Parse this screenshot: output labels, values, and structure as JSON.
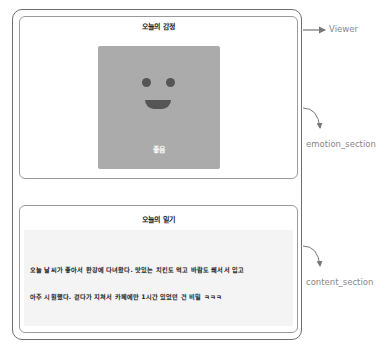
{
  "viewer": {
    "label": "Viewer",
    "emotion_section": {
      "annotation": "emotion_section",
      "title": "오늘의 감정",
      "image": {
        "face": "smiley-face-icon",
        "label": "좋음",
        "background_color": "#ababab",
        "feature_color": "#555555"
      }
    },
    "content_section": {
      "annotation": "content_section",
      "title": "오늘의 일기",
      "lines": [
        "오늘 날씨가 좋아서 한강에 다녀왔다. 맛있는 치킨도 먹고 바람도 쐐서서 입고",
        "아주 시원했다. 걷다가 지쳐서 카페에만 1시간 있었던 건 비밀 ㅋㅋㅋ"
      ]
    }
  },
  "colors": {
    "border": "#6e6e6e",
    "section_border": "#9a9a9a",
    "annotation": "#888888",
    "diary_background": "#f4f4f4"
  }
}
